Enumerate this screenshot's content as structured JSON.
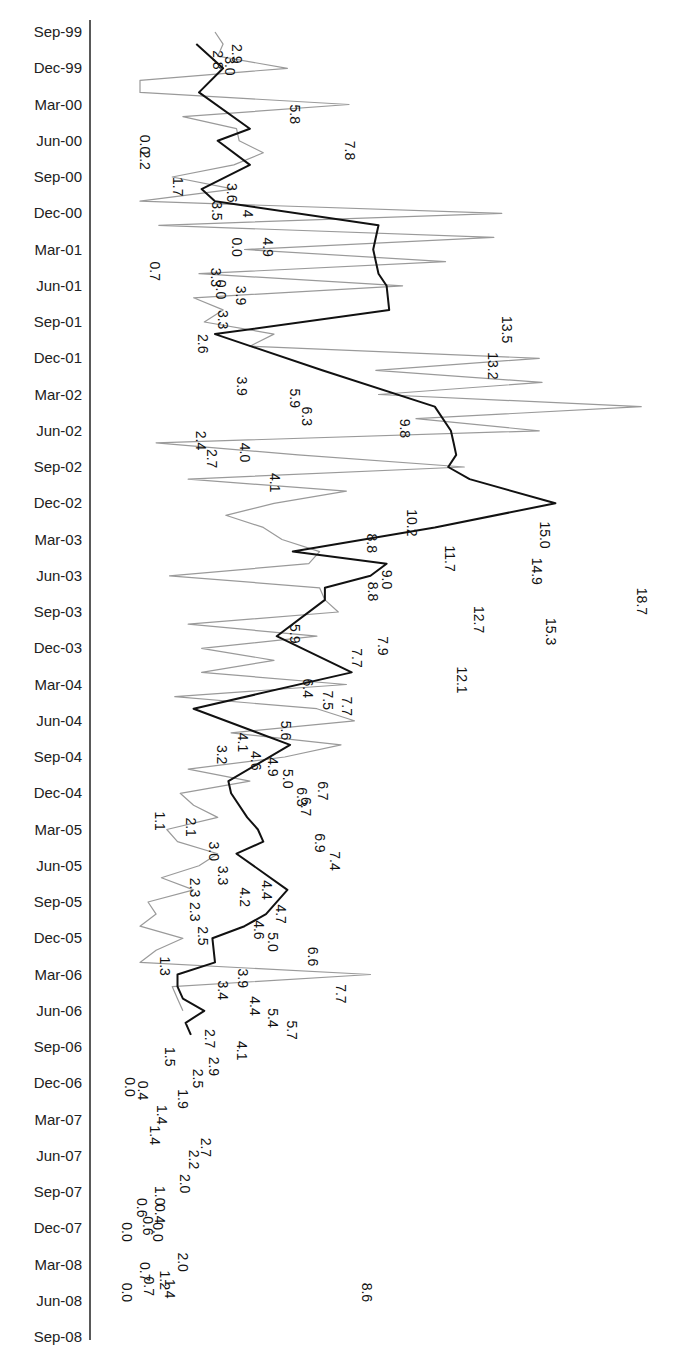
{
  "chart_data": {
    "type": "line",
    "orientation": "rotated-90 (time on vertical axis, values horizontal)",
    "title": "",
    "xlabel": "",
    "ylabel": "",
    "grid": false,
    "legend": null,
    "time_axis_ticks": [
      "Sep-99",
      "Dec-99",
      "Mar-00",
      "Jun-00",
      "Sep-00",
      "Dec-00",
      "Mar-01",
      "Jun-01",
      "Sep-01",
      "Dec-01",
      "Mar-02",
      "Jun-02",
      "Sep-02",
      "Dec-02",
      "Mar-03",
      "Jun-03",
      "Sep-03",
      "Dec-03",
      "Mar-04",
      "Jun-04",
      "Sep-04",
      "Dec-04",
      "Mar-05",
      "Jun-05",
      "Sep-05",
      "Dec-05",
      "Mar-06",
      "Jun-06",
      "Sep-06",
      "Dec-06",
      "Mar-07",
      "Jun-07",
      "Sep-07",
      "Dec-07",
      "Mar-08",
      "Jun-08",
      "Sep-08"
    ],
    "value_range": [
      0,
      19
    ],
    "series": [
      {
        "name": "Monthly",
        "style": "thin gray",
        "color": "#9a9a9a",
        "points": [
          [
            0,
            2.8
          ],
          [
            1,
            3.1
          ],
          [
            2,
            2.9
          ],
          [
            3,
            5.5
          ],
          [
            4,
            0.0
          ],
          [
            5,
            0.0
          ],
          [
            6,
            7.8
          ],
          [
            7,
            1.6
          ],
          [
            8,
            3.6
          ],
          [
            9,
            3.7
          ],
          [
            10,
            4.6
          ],
          [
            11,
            3.5
          ],
          [
            12,
            1.2
          ],
          [
            13,
            3.5
          ],
          [
            14,
            0.0
          ],
          [
            15,
            13.5
          ],
          [
            16,
            0.7
          ],
          [
            17,
            13.2
          ],
          [
            18,
            3.9
          ],
          [
            19,
            11.4
          ],
          [
            20,
            2.2
          ],
          [
            21,
            9.8
          ],
          [
            22,
            2.0
          ],
          [
            23,
            3.1
          ],
          [
            24,
            2.4
          ],
          [
            25,
            5.0
          ],
          [
            26,
            4.1
          ],
          [
            27,
            14.9
          ],
          [
            28,
            8.8
          ],
          [
            29,
            15.0
          ],
          [
            30,
            8.9
          ],
          [
            31,
            18.7
          ],
          [
            32,
            10.3
          ],
          [
            33,
            14.9
          ],
          [
            34,
            0.6
          ],
          [
            35,
            5.9
          ],
          [
            36,
            12.1
          ],
          [
            37,
            1.8
          ],
          [
            38,
            7.7
          ],
          [
            39,
            5.0
          ],
          [
            40,
            3.2
          ],
          [
            41,
            4.6
          ],
          [
            42,
            5.3
          ],
          [
            43,
            6.7
          ],
          [
            44,
            6.3
          ],
          [
            45,
            1.1
          ],
          [
            46,
            6.7
          ],
          [
            47,
            6.9
          ],
          [
            48,
            7.4
          ],
          [
            49,
            1.8
          ],
          [
            50,
            6.6
          ],
          [
            51,
            2.3
          ],
          [
            52,
            5.0
          ],
          [
            53,
            2.3
          ],
          [
            54,
            7.7
          ],
          [
            55,
            1.3
          ],
          [
            56,
            6.6
          ],
          [
            57,
            8.0
          ],
          [
            58,
            3.4
          ],
          [
            59,
            7.5
          ],
          [
            60,
            5.4
          ],
          [
            61,
            1.8
          ],
          [
            62,
            4.1
          ],
          [
            63,
            1.5
          ],
          [
            64,
            2.0
          ],
          [
            65,
            2.9
          ],
          [
            66,
            1.0
          ],
          [
            67,
            1.4
          ],
          [
            68,
            2.9
          ],
          [
            69,
            2.2
          ],
          [
            70,
            0.8
          ],
          [
            71,
            2.0
          ],
          [
            72,
            0.3
          ],
          [
            73,
            0.6
          ],
          [
            74,
            0.0
          ],
          [
            75,
            1.6
          ],
          [
            76,
            0.6
          ],
          [
            77,
            0.0
          ],
          [
            78,
            8.6
          ],
          [
            79,
            1.2
          ],
          [
            80,
            1.4
          ],
          [
            81,
            1.6
          ]
        ]
      },
      {
        "name": "Smoothed",
        "style": "thick black",
        "color": "#111111",
        "points": [
          [
            1,
            2.1
          ],
          [
            3,
            3.1
          ],
          [
            5,
            2.2
          ],
          [
            8,
            4.1
          ],
          [
            9,
            2.9
          ],
          [
            11,
            4.1
          ],
          [
            13,
            2.3
          ],
          [
            14,
            2.8
          ],
          [
            16,
            8.9
          ],
          [
            18,
            8.7
          ],
          [
            20,
            8.9
          ],
          [
            21,
            9.2
          ],
          [
            23,
            9.3
          ],
          [
            25,
            2.8
          ],
          [
            28,
            6.8
          ],
          [
            31,
            11.0
          ],
          [
            33,
            11.6
          ],
          [
            34,
            11.7
          ],
          [
            35,
            11.8
          ],
          [
            36,
            11.5
          ],
          [
            37,
            12.3
          ],
          [
            39,
            15.5
          ],
          [
            41,
            11.0
          ],
          [
            43,
            5.7
          ],
          [
            44,
            9.2
          ],
          [
            45,
            8.6
          ],
          [
            46,
            6.9
          ],
          [
            47,
            6.9
          ],
          [
            50,
            5.1
          ],
          [
            53,
            7.9
          ],
          [
            56,
            2.0
          ],
          [
            59,
            5.6
          ],
          [
            62,
            3.3
          ],
          [
            63,
            3.4
          ],
          [
            65,
            4.0
          ],
          [
            66,
            4.4
          ],
          [
            67,
            4.6
          ],
          [
            68,
            3.6
          ],
          [
            71,
            5.5
          ],
          [
            73,
            4.7
          ],
          [
            74,
            3.9
          ],
          [
            75,
            2.7
          ],
          [
            77,
            2.8
          ],
          [
            78,
            1.4
          ],
          [
            79,
            1.4
          ],
          [
            80,
            1.6
          ],
          [
            81,
            2.4
          ],
          [
            82,
            1.7
          ],
          [
            83,
            1.9
          ]
        ]
      }
    ],
    "data_labels": [
      {
        "text": "2.9",
        "m": 1,
        "x": 232
      },
      {
        "text": "2.8",
        "m": 1.5,
        "x": 213
      },
      {
        "text": "3.0",
        "m": 2,
        "x": 225
      },
      {
        "text": "5.8",
        "m": 6,
        "x": 290
      },
      {
        "text": "7.8",
        "m": 9,
        "x": 345
      },
      {
        "text": "0.0",
        "m": 8.5,
        "x": 140
      },
      {
        "text": "2.2",
        "m": 9.8,
        "x": 140
      },
      {
        "text": "1.7",
        "m": 12,
        "x": 173
      },
      {
        "text": "3.6",
        "m": 12.5,
        "x": 227
      },
      {
        "text": "3.5",
        "m": 14,
        "x": 212
      },
      {
        "text": "4",
        "m": 14.7,
        "x": 243
      },
      {
        "text": "0.0",
        "m": 17,
        "x": 232
      },
      {
        "text": "4.9",
        "m": 17,
        "x": 263
      },
      {
        "text": "0.7",
        "m": 19,
        "x": 150
      },
      {
        "text": "3.3",
        "m": 19.5,
        "x": 211
      },
      {
        "text": "0.0",
        "m": 20.5,
        "x": 216
      },
      {
        "text": "3.9",
        "m": 21,
        "x": 236
      },
      {
        "text": "3.3",
        "m": 23,
        "x": 218
      },
      {
        "text": "13.5",
        "m": 23.5,
        "x": 502
      },
      {
        "text": "2.6",
        "m": 25,
        "x": 198
      },
      {
        "text": "13.2",
        "m": 26.5,
        "x": 488
      },
      {
        "text": "3.9",
        "m": 28.5,
        "x": 237
      },
      {
        "text": "5.9",
        "m": 29.5,
        "x": 290
      },
      {
        "text": "6.3",
        "m": 31,
        "x": 302
      },
      {
        "text": "9.8",
        "m": 32,
        "x": 400
      },
      {
        "text": "2.4",
        "m": 33,
        "x": 196
      },
      {
        "text": "4.0",
        "m": 34,
        "x": 240
      },
      {
        "text": "2.7",
        "m": 34.5,
        "x": 207
      },
      {
        "text": "4.1",
        "m": 36.5,
        "x": 270
      },
      {
        "text": "10.2",
        "m": 39.5,
        "x": 407
      },
      {
        "text": "8.8",
        "m": 41.5,
        "x": 367
      },
      {
        "text": "15.0",
        "m": 40.5,
        "x": 540
      },
      {
        "text": "11.7",
        "m": 42.5,
        "x": 445
      },
      {
        "text": "14.9",
        "m": 43.5,
        "x": 532
      },
      {
        "text": "9.0",
        "m": 44.5,
        "x": 382
      },
      {
        "text": "8.8",
        "m": 45.5,
        "x": 368
      },
      {
        "text": "18.7",
        "m": 46,
        "x": 637
      },
      {
        "text": "12.7",
        "m": 47.5,
        "x": 474
      },
      {
        "text": "15.3",
        "m": 48.5,
        "x": 546
      },
      {
        "text": "5.9",
        "m": 49,
        "x": 290
      },
      {
        "text": "7.9",
        "m": 50,
        "x": 378
      },
      {
        "text": "7.7",
        "m": 51,
        "x": 352
      },
      {
        "text": "12.1",
        "m": 52.5,
        "x": 457
      },
      {
        "text": "6.4",
        "m": 53.5,
        "x": 303
      },
      {
        "text": "7.5",
        "m": 54.5,
        "x": 323
      },
      {
        "text": "7.7",
        "m": 55,
        "x": 342
      },
      {
        "text": "5.6",
        "m": 57,
        "x": 281
      },
      {
        "text": "4.1",
        "m": 58,
        "x": 238
      },
      {
        "text": "3.2",
        "m": 59,
        "x": 217
      },
      {
        "text": "4.6",
        "m": 59.5,
        "x": 251
      },
      {
        "text": "4.9",
        "m": 60,
        "x": 268
      },
      {
        "text": "5.0",
        "m": 61,
        "x": 283
      },
      {
        "text": "6.3",
        "m": 62.5,
        "x": 297
      },
      {
        "text": "6.7",
        "m": 62,
        "x": 318
      },
      {
        "text": "6.7",
        "m": 63.3,
        "x": 301
      },
      {
        "text": "1.1",
        "m": 64.5,
        "x": 155
      },
      {
        "text": "2.1",
        "m": 65,
        "x": 186
      },
      {
        "text": "6.9",
        "m": 66.3,
        "x": 315
      },
      {
        "text": "3.0",
        "m": 67,
        "x": 209
      },
      {
        "text": "7.4",
        "m": 67.8,
        "x": 330
      },
      {
        "text": "3.3",
        "m": 69,
        "x": 218
      },
      {
        "text": "2.3",
        "m": 70,
        "x": 190
      },
      {
        "text": "4.2",
        "m": 70.8,
        "x": 240
      },
      {
        "text": "4.4",
        "m": 70.2,
        "x": 262
      },
      {
        "text": "2.3",
        "m": 72,
        "x": 190
      },
      {
        "text": "4.7",
        "m": 72.2,
        "x": 276
      },
      {
        "text": "4.6",
        "m": 73.5,
        "x": 254
      },
      {
        "text": "2.5",
        "m": 74,
        "x": 198
      },
      {
        "text": "5.0",
        "m": 74.5,
        "x": 268
      },
      {
        "text": "6.6",
        "m": 75.7,
        "x": 308
      },
      {
        "text": "1.3",
        "m": 76.5,
        "x": 160
      },
      {
        "text": "3.9",
        "m": 77.5,
        "x": 238
      },
      {
        "text": "3.4",
        "m": 78.5,
        "x": 218
      },
      {
        "text": "7.7",
        "m": 78.8,
        "x": 336
      },
      {
        "text": "4.4",
        "m": 79.8,
        "x": 250
      },
      {
        "text": "5.4",
        "m": 80.8,
        "x": 268
      },
      {
        "text": "5.7",
        "m": 81.8,
        "x": 287
      },
      {
        "text": "2.7",
        "m": 82.5,
        "x": 205
      },
      {
        "text": "4.1",
        "m": 83.5,
        "x": 237
      },
      {
        "text": "1.5",
        "m": 84,
        "x": 165
      },
      {
        "text": "2.9",
        "m": 84.8,
        "x": 209
      },
      {
        "text": "2.5",
        "m": 85.8,
        "x": 193
      },
      {
        "text": "0.4",
        "m": 86.8,
        "x": 138
      },
      {
        "text": "0.0",
        "m": 86.5,
        "x": 125
      },
      {
        "text": "1.9",
        "m": 87.5,
        "x": 178
      },
      {
        "text": "1.4",
        "m": 88.8,
        "x": 157
      },
      {
        "text": "1.4",
        "m": 90.5,
        "x": 150
      },
      {
        "text": "2.7",
        "m": 91.5,
        "x": 201
      },
      {
        "text": "2.2",
        "m": 92.5,
        "x": 189
      },
      {
        "text": "2.0",
        "m": 94.5,
        "x": 180
      },
      {
        "text": "1.0",
        "m": 95.5,
        "x": 155
      },
      {
        "text": "0.6",
        "m": 96.5,
        "x": 137
      },
      {
        "text": "0.4",
        "m": 97,
        "x": 155
      },
      {
        "text": "0.6",
        "m": 98,
        "x": 143
      },
      {
        "text": "0.0",
        "m": 98.5,
        "x": 122
      },
      {
        "text": "0.0",
        "m": 98.5,
        "x": 153
      },
      {
        "text": "2.0",
        "m": 101,
        "x": 178
      },
      {
        "text": "0.7",
        "m": 101.8,
        "x": 140
      },
      {
        "text": "1.2",
        "m": 102.5,
        "x": 160
      },
      {
        "text": "1.4",
        "m": 103.2,
        "x": 165
      },
      {
        "text": "0.7",
        "m": 103,
        "x": 144
      },
      {
        "text": "0.0",
        "m": 103.5,
        "x": 122
      },
      {
        "text": "8.6",
        "m": 103.5,
        "x": 362
      }
    ]
  },
  "layout": {
    "axis_x": 90,
    "axis_top": 20,
    "axis_bottom": 1340,
    "first_tick_y": 32,
    "tick_spacing": 36.25,
    "zero_x": 140,
    "px_per_unit": 26.8,
    "label_right_edge": 82
  }
}
